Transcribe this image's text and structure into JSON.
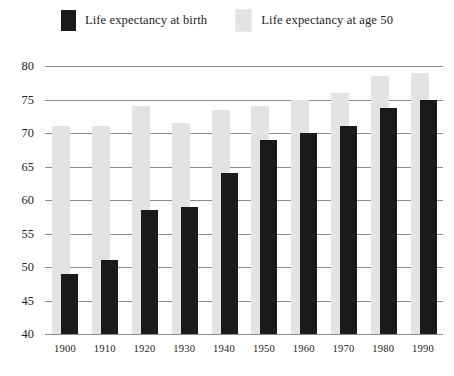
{
  "chart_data": {
    "type": "bar",
    "title": "",
    "subtitle": "",
    "xlabel": "",
    "ylabel": "",
    "ylim": [
      40,
      80
    ],
    "ytick_step": 5,
    "yticks": [
      "40",
      "45",
      "50",
      "55",
      "60",
      "65",
      "70",
      "75",
      "80"
    ],
    "grid": true,
    "grid_axis": "y",
    "legend_position": "top-center",
    "bar_style": "overlapping-pairs",
    "categories": [
      "1900",
      "1910",
      "1920",
      "1930",
      "1940",
      "1950",
      "1960",
      "1970",
      "1980",
      "1990"
    ],
    "series": [
      {
        "name": "Life expectancy at birth",
        "color": "#1c1a18",
        "values": [
          49,
          51,
          58.5,
          59,
          64,
          69,
          70,
          71,
          73.7,
          75
        ]
      },
      {
        "name": "Life expectancy at age 50",
        "color": "#e3e3e1",
        "values": [
          71,
          71,
          74,
          71.5,
          73.5,
          74,
          75,
          76,
          78.5,
          79
        ]
      }
    ]
  },
  "legend": {
    "entries": [
      {
        "label": "Life expectancy at birth",
        "swatch": "dark-swatch"
      },
      {
        "label": "Life expectancy at age 50",
        "swatch": "light-swatch"
      }
    ]
  },
  "colors": {
    "bar_dark": "#1c1a18",
    "bar_light": "#e3e3e1",
    "gridline": "#8d8d8d",
    "text": "#231f1c",
    "background": "#ffffff"
  }
}
